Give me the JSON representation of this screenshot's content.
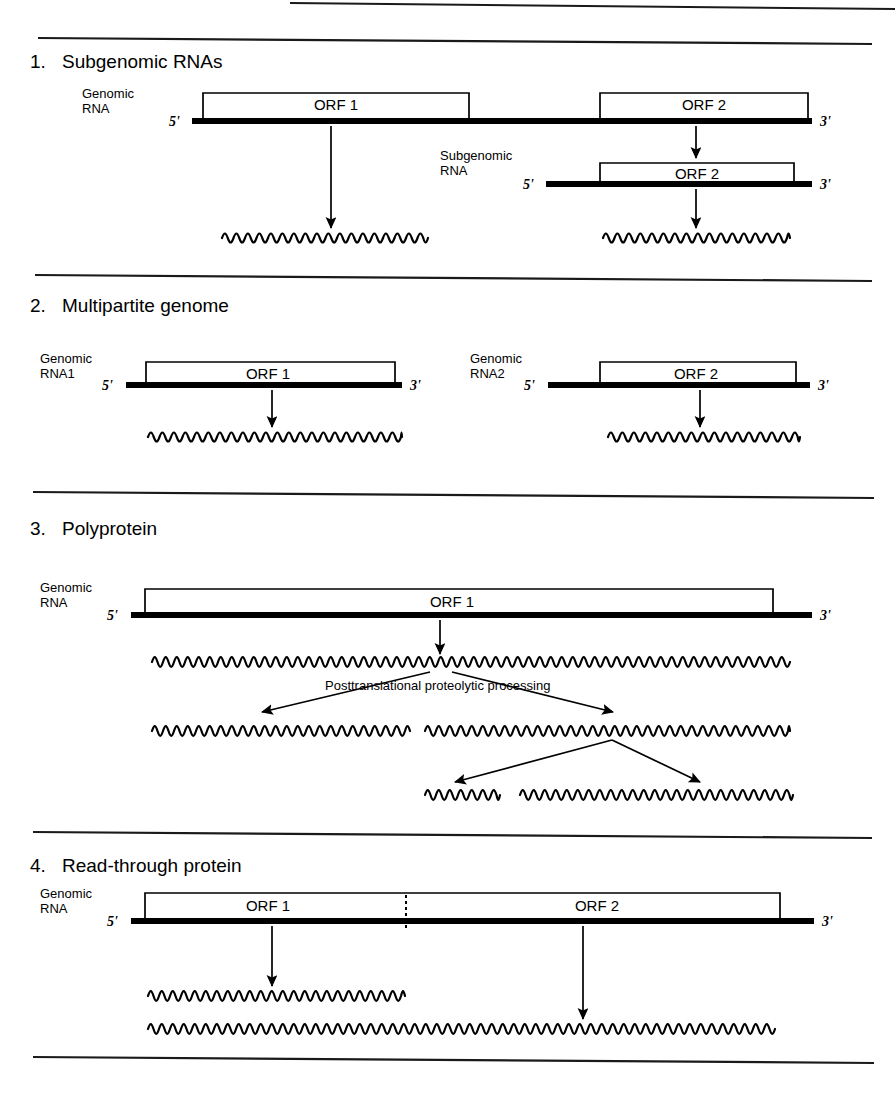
{
  "document": {
    "title": "Viral genome expression strategies",
    "width": 895,
    "height": 1094,
    "background": "#ffffff",
    "ink": "#000000"
  },
  "labels": {
    "five_prime": "5'",
    "three_prime": "3'",
    "orf1": "ORF 1",
    "orf2": "ORF 2",
    "genomic_rna": "Genomic\nRNA",
    "genomic_rna_line1": "Genomic",
    "genomic_rna_line2": "RNA",
    "genomic_rna1_line2": "RNA1",
    "genomic_rna2_line2": "RNA2",
    "subgenomic_rna_line1": "Subgenomic",
    "subgenomic_rna_line2": "RNA",
    "posttranslational": "Posttranslational  proteolytic  processing"
  },
  "rules": [
    {
      "name": "rule-top-partial",
      "x1": 290,
      "y1": 3,
      "x2": 895,
      "y2": 9
    },
    {
      "name": "rule-header",
      "x1": 38,
      "y1": 38,
      "x2": 872,
      "y2": 44
    },
    {
      "name": "rule-section-1-2",
      "x1": 35,
      "y1": 275,
      "x2": 872,
      "y2": 281
    },
    {
      "name": "rule-section-2-3",
      "x1": 33,
      "y1": 492,
      "x2": 874,
      "y2": 498
    },
    {
      "name": "rule-section-3-4",
      "x1": 33,
      "y1": 832,
      "x2": 872,
      "y2": 838
    },
    {
      "name": "rule-footer",
      "x1": 33,
      "y1": 1057,
      "x2": 874,
      "y2": 1063
    }
  ],
  "sections": [
    {
      "id": "subgenomic-rnas",
      "number": "1.",
      "title": "Subgenomic RNAs",
      "number_x": 30,
      "title_x": 62,
      "title_y": 68
    },
    {
      "id": "multipartite-genome",
      "number": "2.",
      "title": "Multipartite genome",
      "number_x": 30,
      "title_x": 62,
      "title_y": 312
    },
    {
      "id": "polyprotein",
      "number": "3.",
      "title": "Polyprotein",
      "number_x": 30,
      "title_x": 62,
      "title_y": 535
    },
    {
      "id": "read-through-protein",
      "number": "4.",
      "title": "Read-through protein",
      "number_x": 30,
      "title_x": 62,
      "title_y": 872
    }
  ],
  "rna_constructs": [
    {
      "id": "s1-genomic",
      "section": "subgenomic-rnas",
      "label_lines": [
        "Genomic",
        "RNA"
      ],
      "label_x": 82,
      "label_y": 98,
      "five_x": 180,
      "three_x": 820,
      "line_y": 121,
      "line_x1": 192,
      "line_x2": 812,
      "orfs": [
        {
          "label": "ORF 1",
          "x1": 203,
          "x2": 469,
          "top_y": 93,
          "label_x": 336,
          "label_y": 110
        },
        {
          "label": "ORF 2",
          "x1": 600,
          "x2": 808,
          "top_y": 93,
          "label_x": 704,
          "label_y": 110
        }
      ],
      "stop_dash": null
    },
    {
      "id": "s1-subgenomic",
      "section": "subgenomic-rnas",
      "label_lines": [
        "Subgenomic",
        "RNA"
      ],
      "label_x": 440,
      "label_y": 160,
      "five_x": 534,
      "three_x": 820,
      "line_y": 184,
      "line_x1": 546,
      "line_x2": 812,
      "orfs": [
        {
          "label": "ORF 2",
          "x1": 600,
          "x2": 794,
          "top_y": 163,
          "label_x": 697,
          "label_y": 179
        }
      ],
      "stop_dash": null
    },
    {
      "id": "s2-genomic-rna1",
      "section": "multipartite-genome",
      "label_lines": [
        "Genomic",
        "RNA1"
      ],
      "label_x": 40,
      "label_y": 363,
      "five_x": 113,
      "three_x": 410,
      "line_y": 385,
      "line_x1": 126,
      "line_x2": 402,
      "orfs": [
        {
          "label": "ORF 1",
          "x1": 146,
          "x2": 395,
          "top_y": 362,
          "label_x": 268,
          "label_y": 379
        }
      ],
      "stop_dash": null
    },
    {
      "id": "s2-genomic-rna2",
      "section": "multipartite-genome",
      "label_lines": [
        "Genomic",
        "RNA2"
      ],
      "label_x": 470,
      "label_y": 363,
      "five_x": 535,
      "three_x": 818,
      "line_y": 385,
      "line_x1": 548,
      "line_x2": 810,
      "orfs": [
        {
          "label": "ORF 2",
          "x1": 600,
          "x2": 796,
          "top_y": 362,
          "label_x": 696,
          "label_y": 379
        }
      ],
      "stop_dash": null
    },
    {
      "id": "s3-genomic",
      "section": "polyprotein",
      "label_lines": [
        "Genomic",
        "RNA"
      ],
      "label_x": 40,
      "label_y": 592,
      "five_x": 118,
      "three_x": 820,
      "line_y": 615,
      "line_x1": 131,
      "line_x2": 812,
      "orfs": [
        {
          "label": "ORF 1",
          "x1": 145,
          "x2": 773,
          "top_y": 589,
          "label_x": 452,
          "label_y": 607
        }
      ],
      "stop_dash": null
    },
    {
      "id": "s4-genomic",
      "section": "read-through-protein",
      "label_lines": [
        "Genomic",
        "RNA"
      ],
      "label_x": 40,
      "label_y": 898,
      "five_x": 118,
      "three_x": 822,
      "line_y": 921,
      "line_x1": 131,
      "line_x2": 814,
      "orfs": [
        {
          "label": "ORF 1",
          "x1": 145,
          "x2": 780,
          "top_y": 893,
          "label_x": 268,
          "label_y": 911
        },
        {
          "label": "ORF 2",
          "x1": null,
          "x2": null,
          "top_y": null,
          "label_x": 597,
          "label_y": 911
        }
      ],
      "stop_dash": {
        "x": 406,
        "y1": 895,
        "y2": 930
      }
    }
  ],
  "waves": [
    {
      "id": "s1-orf1-protein",
      "x1": 222,
      "x2": 428,
      "y": 238,
      "amplitude": 6,
      "period": 11.5
    },
    {
      "id": "s1-orf2-protein",
      "x1": 603,
      "x2": 790,
      "y": 238,
      "amplitude": 6,
      "period": 11.5
    },
    {
      "id": "s2-rna1-protein",
      "x1": 148,
      "x2": 402,
      "y": 437,
      "amplitude": 6,
      "period": 11.5
    },
    {
      "id": "s2-rna2-protein",
      "x1": 608,
      "x2": 800,
      "y": 437,
      "amplitude": 6,
      "period": 11.5
    },
    {
      "id": "s3-polyprotein",
      "x1": 152,
      "x2": 790,
      "y": 662,
      "amplitude": 6.5,
      "period": 11.0
    },
    {
      "id": "s3-cleaved-left",
      "x1": 152,
      "x2": 410,
      "y": 731,
      "amplitude": 6.5,
      "period": 11.0
    },
    {
      "id": "s3-cleaved-right",
      "x1": 425,
      "x2": 790,
      "y": 731,
      "amplitude": 6.5,
      "period": 11.0
    },
    {
      "id": "s3-final-short",
      "x1": 425,
      "x2": 500,
      "y": 795,
      "amplitude": 6.5,
      "period": 11.0
    },
    {
      "id": "s3-final-long",
      "x1": 520,
      "x2": 793,
      "y": 795,
      "amplitude": 6.5,
      "period": 11.0
    },
    {
      "id": "s4-orf1-protein",
      "x1": 148,
      "x2": 405,
      "y": 996,
      "amplitude": 6.5,
      "period": 11.0
    },
    {
      "id": "s4-readthrough-protein",
      "x1": 148,
      "x2": 775,
      "y": 1029,
      "amplitude": 6.5,
      "period": 11.0
    }
  ],
  "arrows": [
    {
      "id": "s1-genomic-orf1-to-protein",
      "x1": 331,
      "y1": 126,
      "x2": 331,
      "y2": 228,
      "head": 9
    },
    {
      "id": "s1-genomic-orf2-to-subgenomic",
      "x1": 696,
      "y1": 126,
      "x2": 696,
      "y2": 158,
      "head": 9
    },
    {
      "id": "s1-subgenomic-to-protein",
      "x1": 696,
      "y1": 189,
      "x2": 696,
      "y2": 228,
      "head": 9
    },
    {
      "id": "s2-rna1-to-protein",
      "x1": 272,
      "y1": 390,
      "x2": 272,
      "y2": 427,
      "head": 9
    },
    {
      "id": "s2-rna2-to-protein",
      "x1": 700,
      "y1": 390,
      "x2": 700,
      "y2": 427,
      "head": 9
    },
    {
      "id": "s3-genomic-to-polyprotein",
      "x1": 440,
      "y1": 620,
      "x2": 440,
      "y2": 654,
      "head": 9
    },
    {
      "id": "s3-cleave-to-left",
      "x1": 430,
      "y1": 672,
      "x2": 262,
      "y2": 712,
      "head": 9
    },
    {
      "id": "s3-cleave-to-right",
      "x1": 452,
      "y1": 672,
      "x2": 613,
      "y2": 712,
      "head": 9
    },
    {
      "id": "s3-cleave2-to-left",
      "x1": 612,
      "y1": 740,
      "x2": 455,
      "y2": 782,
      "head": 9
    },
    {
      "id": "s3-cleave2-to-right",
      "x1": 612,
      "y1": 740,
      "x2": 700,
      "y2": 782,
      "head": 9
    },
    {
      "id": "s4-orf1-to-protein",
      "x1": 272,
      "y1": 926,
      "x2": 272,
      "y2": 986,
      "head": 9
    },
    {
      "id": "s4-orf2-to-readthrough",
      "x1": 583,
      "y1": 926,
      "x2": 583,
      "y2": 1019,
      "head": 9
    }
  ],
  "annotations": [
    {
      "id": "posttranslational-processing",
      "text": "Posttranslational  proteolytic  processing",
      "x": 325,
      "y": 690
    }
  ]
}
